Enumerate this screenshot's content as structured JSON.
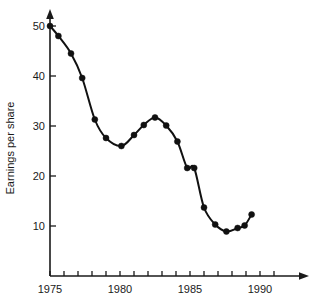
{
  "chart_data": {
    "type": "line",
    "title": "",
    "subtitle": "",
    "xlabel": "",
    "ylabel": "Earnings per share",
    "xlim": [
      1975,
      1992
    ],
    "ylim": [
      0,
      52
    ],
    "grid": false,
    "legend": "none",
    "x_tick_labels": [
      "1975",
      "1980",
      "1985",
      "1990"
    ],
    "x_tick_label_values": [
      1975,
      1980,
      1985,
      1990
    ],
    "x_minor_ticks": [
      1975,
      1976,
      1977,
      1978,
      1979,
      1980,
      1981,
      1982,
      1983,
      1984,
      1985,
      1986,
      1987,
      1988,
      1989,
      1990,
      1991
    ],
    "y_tick_labels": [
      "10",
      "20",
      "30",
      "40",
      "50"
    ],
    "y_tick_label_values": [
      10,
      20,
      30,
      40,
      50
    ],
    "marker": "filled-circle",
    "marker_color": "#111111",
    "line_color": "#111111",
    "series": [
      {
        "name": "Earnings per share",
        "x": [
          1975.0,
          1975.6,
          1976.5,
          1977.3,
          1978.2,
          1979.0,
          1980.1,
          1981.0,
          1981.7,
          1982.5,
          1983.3,
          1984.1,
          1984.8,
          1985.3,
          1986.0,
          1986.8,
          1987.6,
          1988.4,
          1988.9,
          1989.4
        ],
        "y": [
          50.0,
          48.0,
          44.5,
          39.6,
          31.3,
          27.6,
          26.0,
          28.2,
          30.2,
          31.7,
          30.1,
          26.9,
          21.6,
          21.6,
          13.7,
          10.3,
          8.9,
          9.6,
          10.1,
          12.3
        ],
        "values": [
          50.0,
          48.0,
          44.5,
          39.6,
          31.3,
          27.6,
          26.0,
          28.2,
          30.2,
          31.7,
          30.1,
          26.9,
          21.6,
          21.6,
          13.7,
          10.3,
          8.9,
          9.6,
          10.1,
          12.3
        ]
      }
    ],
    "annotations": []
  },
  "axes": {
    "y_axis_title": "Earnings per share"
  }
}
